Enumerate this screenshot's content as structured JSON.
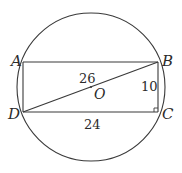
{
  "figure": {
    "type": "circle-inscribed-rectangle",
    "circle": {
      "cx": 91,
      "cy": 87,
      "r": 74,
      "center_label": "O"
    },
    "points": {
      "A": {
        "label": "A",
        "x": 23,
        "y": 62
      },
      "B": {
        "label": "B",
        "x": 158,
        "y": 62
      },
      "C": {
        "label": "C",
        "x": 158,
        "y": 112
      },
      "D": {
        "label": "D",
        "x": 23,
        "y": 112
      }
    },
    "segments": [
      {
        "from": "A",
        "to": "B"
      },
      {
        "from": "B",
        "to": "C"
      },
      {
        "from": "C",
        "to": "D"
      },
      {
        "from": "D",
        "to": "A"
      },
      {
        "from": "D",
        "to": "B"
      }
    ],
    "measurements": {
      "DB": "26",
      "BC": "10",
      "DC": "24"
    },
    "right_angle_at": "C",
    "colors": {
      "stroke": "#3a3a3a",
      "text": "#2b2b2b",
      "background": "#ffffff"
    }
  }
}
